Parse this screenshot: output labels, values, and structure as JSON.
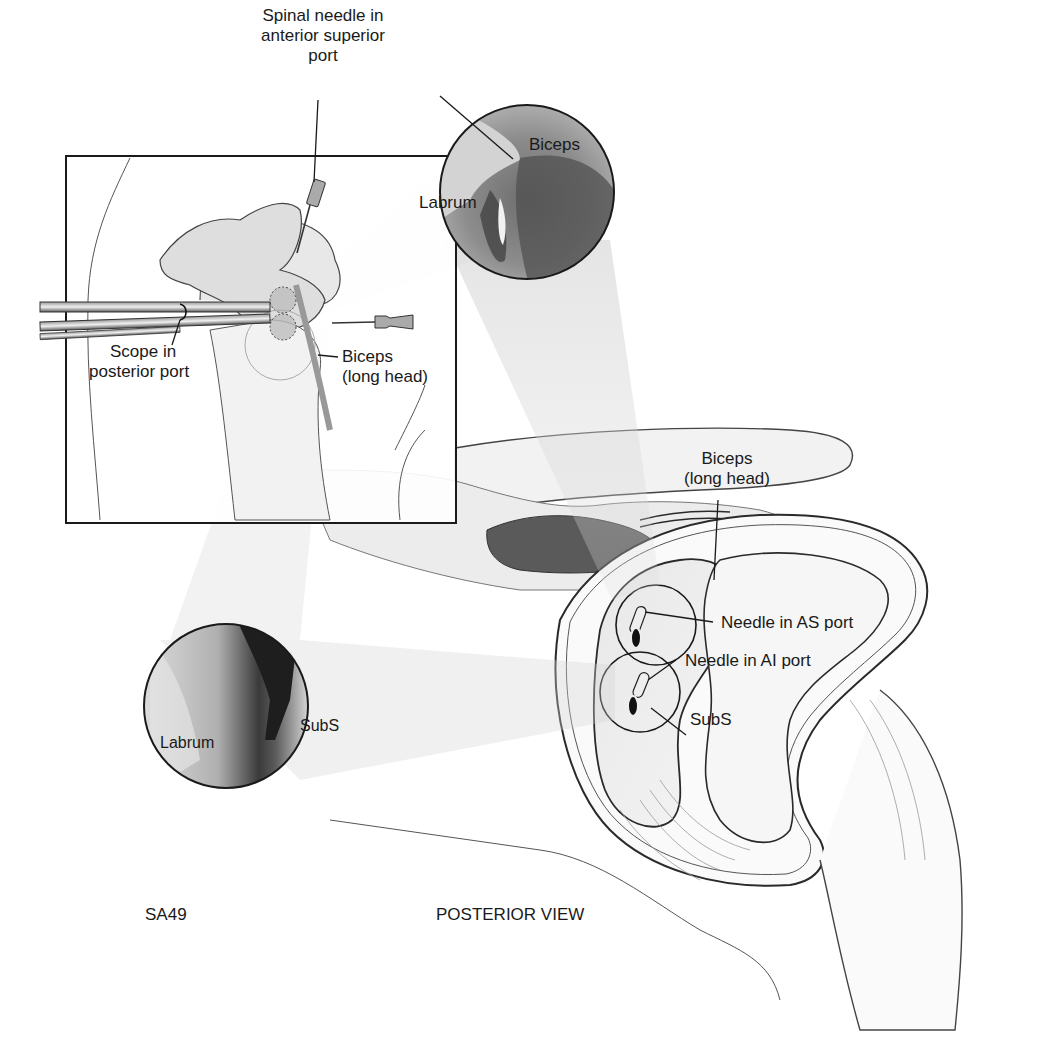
{
  "figure": {
    "id_label": "SA49",
    "view_label": "POSTERIOR VIEW"
  },
  "inset": {
    "labels": {
      "spinal_needle_line1": "Spinal needle in",
      "spinal_needle_line2": "anterior superior",
      "spinal_needle_line3": "port",
      "scope_line1": "Scope in",
      "scope_line2": "posterior port",
      "biceps_line1": "Biceps",
      "biceps_line2": "(long head)"
    }
  },
  "arthroscopic_view_top": {
    "labels": {
      "biceps": "Biceps",
      "labrum": "Labrum"
    }
  },
  "arthroscopic_view_bottom": {
    "labels": {
      "subs": "SubS",
      "labrum": "Labrum"
    }
  },
  "main_view": {
    "labels": {
      "biceps_line1": "Biceps",
      "biceps_line2": "(long head)",
      "needle_as": "Needle in AS port",
      "needle_ai": "Needle in AI port",
      "subs": "SubS"
    }
  },
  "colors": {
    "ink": "#1a1a1a",
    "scope_dark": "#3a3a3a",
    "tissue_light": "#e6e6e6",
    "tissue_mid": "#b8b8b8",
    "tissue_dark": "#4a4a4a",
    "cone": "#d8d8d8"
  }
}
